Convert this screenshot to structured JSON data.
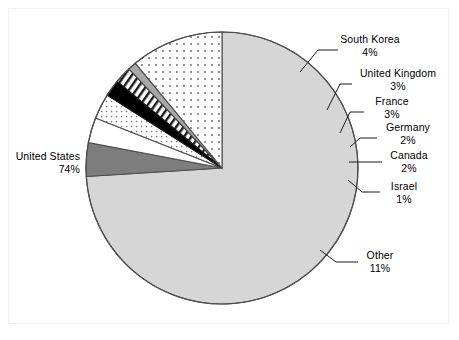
{
  "chart_data": {
    "type": "pie",
    "title": "",
    "subtitle": "",
    "xlabel": "",
    "ylabel": "",
    "legend_position": "callout-labels",
    "grid": false,
    "value_suffix": "%",
    "categories": [
      "United States",
      "South Korea",
      "United Kingdom",
      "France",
      "Germany",
      "Canada",
      "Israel",
      "Other"
    ],
    "values": [
      74,
      4,
      3,
      3,
      2,
      2,
      1,
      11
    ],
    "slices": [
      {
        "label": "United States",
        "value": 74,
        "value_text": "74%",
        "fill": "light-gray",
        "color": "#d4d4d4"
      },
      {
        "label": "South Korea",
        "value": 4,
        "value_text": "4%",
        "fill": "dark-gray",
        "color": "#7a7a7a"
      },
      {
        "label": "United Kingdom",
        "value": 3,
        "value_text": "3%",
        "fill": "white",
        "color": "#ffffff"
      },
      {
        "label": "France",
        "value": 3,
        "value_text": "3%",
        "fill": "small-dots",
        "color": "#ffffff"
      },
      {
        "label": "Germany",
        "value": 2,
        "value_text": "2%",
        "fill": "black",
        "color": "#000000"
      },
      {
        "label": "Canada",
        "value": 2,
        "value_text": "2%",
        "fill": "diagonal-hatch",
        "color": "#ffffff"
      },
      {
        "label": "Israel",
        "value": 1,
        "value_text": "1%",
        "fill": "medium-gray",
        "color": "#a6a6a6"
      },
      {
        "label": "Other",
        "value": 11,
        "value_text": "11%",
        "fill": "dots",
        "color": "#ffffff"
      }
    ],
    "outline_color": "#4d4d4d",
    "center": {
      "x": 222,
      "y": 168
    },
    "radius": 136,
    "start_angle_deg": -90
  },
  "labels": {
    "united_states": {
      "name": "United States",
      "value": "74%"
    },
    "south_korea": {
      "name": "South Korea",
      "value": "4%"
    },
    "united_kingdom": {
      "name": "United Kingdom",
      "value": "3%"
    },
    "france": {
      "name": "France",
      "value": "3%"
    },
    "germany": {
      "name": "Germany",
      "value": "2%"
    },
    "canada": {
      "name": "Canada",
      "value": "2%"
    },
    "israel": {
      "name": "Israel",
      "value": "1%"
    },
    "other": {
      "name": "Other",
      "value": "11%"
    }
  }
}
